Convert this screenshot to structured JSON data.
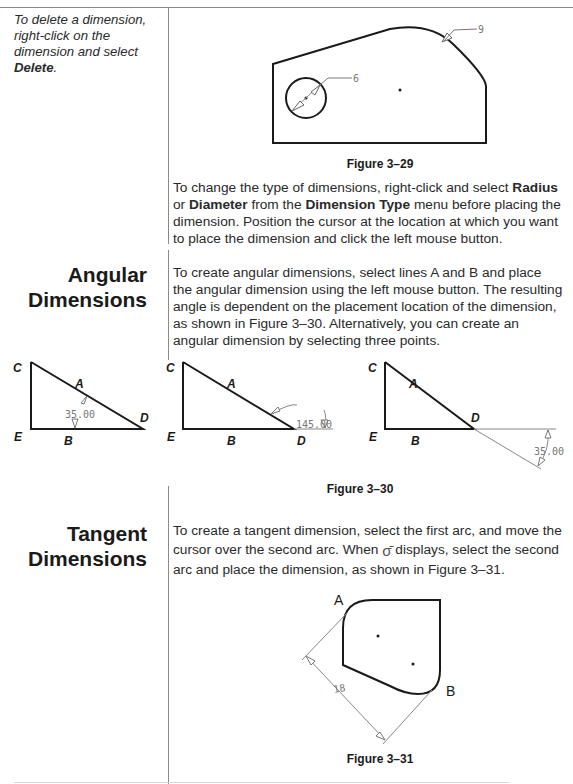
{
  "side_note": {
    "text": "To delete a dimension, right-click on the dimension and select ",
    "bold": "Delete",
    "end": "."
  },
  "figure_29": {
    "caption": "Figure 3–29",
    "dim_radius": "9",
    "dim_diameter": "6"
  },
  "para_dimension_type": {
    "t1": "To change the type of dimensions, right-click and select ",
    "b1": "Radius",
    "t2": " or ",
    "b2": "Diameter",
    "t3": " from the ",
    "b3": "Dimension Type",
    "t4": " menu before placing the dimension. Position the cursor at the location at which you want to place the dimension and click the left mouse button."
  },
  "angular": {
    "heading_line1": "Angular",
    "heading_line2": "Dimensions",
    "paragraph": "To create angular dimensions, select lines A and B and place the angular dimension using the left mouse button. The resulting angle is dependent on the placement location of the dimension, as shown in Figure 3–30. Alternatively, you can create an angular dimension by selecting three points."
  },
  "figure_30": {
    "caption": "Figure 3–30",
    "labels": {
      "c": "C",
      "a": "A",
      "d": "D",
      "e": "E",
      "b": "B"
    },
    "dims": [
      "35.00",
      "145.00",
      "35.00"
    ]
  },
  "tangent": {
    "heading_line1": "Tangent",
    "heading_line2": "Dimensions",
    "t1": "To create a tangent dimension, select the first arc, and move the cursor over the second arc. When ",
    "icon": "tangent-cursor-icon",
    "t2": " displays, select the second arc and place the dimension, as shown in Figure 3–31."
  },
  "figure_31": {
    "caption": "Figure 3–31",
    "label_a": "A",
    "label_b": "B",
    "dim": "18"
  }
}
